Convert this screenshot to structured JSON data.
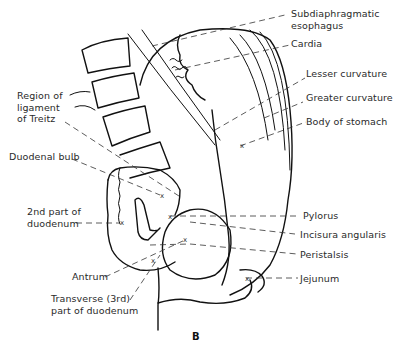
{
  "figure": {
    "panel_letter": "B",
    "caption_partial": "Fig. — Diagram of stomach and duodenum"
  },
  "labels": {
    "subdiaphragmatic_esophagus": [
      "Subdiaphragmatic",
      "esophagus"
    ],
    "cardia": "Cardia",
    "lesser_curvature": "Lesser curvature",
    "greater_curvature": "Greater curvature",
    "body_of_stomach": "Body of stomach",
    "ligament_of_treitz": [
      "Region of",
      "ligament",
      "of Treitz"
    ],
    "duodenal_bulb": "Duodenal bulb",
    "second_part_duodenum": [
      "2nd part of",
      "duodenum"
    ],
    "pylorus": "Pylorus",
    "incisura_angularis": "Incisura angularis",
    "peristalsis": "Peristalsis",
    "antrum": "Antrum",
    "jejunum": "Jejunum",
    "transverse_duodenum": [
      "Transverse (3rd)",
      "part of duodenum"
    ]
  },
  "markers": {
    "x": "x"
  }
}
